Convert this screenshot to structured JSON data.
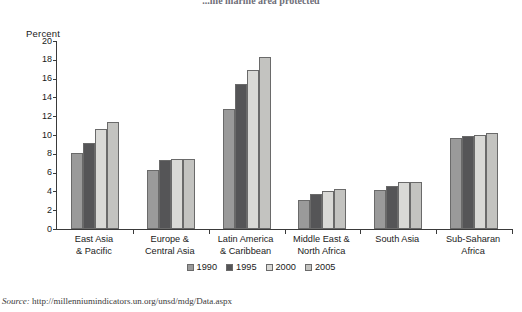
{
  "title_clipped": "...ine marine area protected",
  "axis_title": "Percent",
  "source_label": "Source:",
  "source_url": "http://millenniumindicators.un.org/unsd/mdg/Data.aspx",
  "legend": {
    "position": "bottom-center",
    "entries": [
      {
        "label": "1990",
        "color": "#9a9a9a"
      },
      {
        "label": "1995",
        "color": "#555557"
      },
      {
        "label": "2000",
        "color": "#d9d9d6"
      },
      {
        "label": "2005",
        "color": "#c3c3c0"
      }
    ]
  },
  "chart_data": {
    "type": "bar",
    "title": "...ine marine area protected",
    "xlabel": "",
    "ylabel": "Percent",
    "ylim": [
      0,
      20
    ],
    "yticks": [
      0,
      2,
      4,
      6,
      8,
      10,
      12,
      14,
      16,
      18,
      20
    ],
    "grid": false,
    "legend_position": "bottom-center",
    "categories": [
      "East Asia\n& Pacific",
      "Europe &\nCentral Asia",
      "Latin America\n& Caribbean",
      "Middle East &\nNorth Africa",
      "South Asia",
      "Sub-Saharan\nAfrica"
    ],
    "category_lines": [
      [
        "East Asia",
        "& Pacific"
      ],
      [
        "Europe &",
        "Central Asia"
      ],
      [
        "Latin America",
        "& Caribbean"
      ],
      [
        "Middle East &",
        "North Africa"
      ],
      [
        "South Asia",
        ""
      ],
      [
        "Sub-Saharan",
        "Africa"
      ]
    ],
    "series": [
      {
        "name": "1990",
        "color": "#9a9a9a",
        "values": [
          8.1,
          6.3,
          12.8,
          3.1,
          4.1,
          9.7
        ]
      },
      {
        "name": "1995",
        "color": "#555557",
        "values": [
          9.1,
          7.3,
          15.4,
          3.7,
          4.6,
          9.9
        ]
      },
      {
        "name": "2000",
        "color": "#d9d9d6",
        "values": [
          10.6,
          7.5,
          16.9,
          4.0,
          5.0,
          10.0
        ]
      },
      {
        "name": "2005",
        "color": "#c3c3c0",
        "values": [
          11.4,
          7.5,
          18.3,
          4.3,
          5.0,
          10.2
        ]
      }
    ]
  }
}
